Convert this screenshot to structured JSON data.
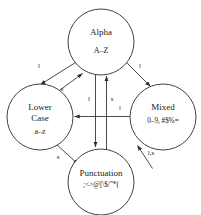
{
  "diagram": {
    "type": "state-transition-diagram",
    "nodes": [
      {
        "id": "alpha",
        "title": "Alpha",
        "charset": "A–Z",
        "cx": 101,
        "cy": 42,
        "r": 33
      },
      {
        "id": "lower-case",
        "title_line1": "Lower",
        "title_line2": "Case",
        "charset": "a–z",
        "cx": 40,
        "cy": 117,
        "r": 33
      },
      {
        "id": "mixed",
        "title": "Mixed",
        "charset": "0–9,    #$%=",
        "cx": 163,
        "cy": 117,
        "r": 33
      },
      {
        "id": "punctuation",
        "title": "Punctuation",
        "charset": ";<>@[\\$/\"*(",
        "cx": 101,
        "cy": 182,
        "r": 33
      }
    ],
    "edges": [
      {
        "id": "alpha-to-lower",
        "from": "alpha",
        "to": "lower-case",
        "label": "l"
      },
      {
        "id": "lower-to-alpha",
        "from": "lower-case",
        "to": "alpha",
        "label": "s"
      },
      {
        "id": "alpha-to-mixed",
        "from": "alpha",
        "to": "mixed",
        "label": "l"
      },
      {
        "id": "alpha-to-punctuation",
        "from": "alpha",
        "to": "punctuation",
        "label": "l"
      },
      {
        "id": "punctuation-to-alpha",
        "from": "punctuation",
        "to": "alpha",
        "label": "s"
      },
      {
        "id": "mixed-to-lower",
        "from": "mixed",
        "to": "lower-case",
        "label": "l"
      },
      {
        "id": "lower-to-punctuation",
        "from": "lower-case",
        "to": "punctuation",
        "label": "s"
      },
      {
        "id": "punctuation-to-mixed",
        "from": "punctuation",
        "to": "mixed",
        "label": "l,s"
      }
    ],
    "colors": {
      "stroke": "#2b2b2b",
      "text": "#1a1a1a",
      "background": "#ffffff"
    }
  }
}
